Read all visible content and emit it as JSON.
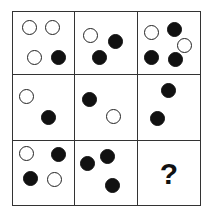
{
  "puzzle": {
    "rows": 3,
    "cols": 3,
    "colors": {
      "black": "#111111",
      "white": "#ffffff",
      "border": "#333333"
    },
    "cells": [
      {
        "row": 0,
        "col": 0,
        "dots": [
          {
            "type": "white",
            "x": 9,
            "y": 8
          },
          {
            "type": "white",
            "x": 32,
            "y": 8
          },
          {
            "type": "white",
            "x": 14,
            "y": 38
          },
          {
            "type": "black",
            "x": 38,
            "y": 38
          }
        ]
      },
      {
        "row": 0,
        "col": 1,
        "dots": [
          {
            "type": "white",
            "x": 8,
            "y": 16
          },
          {
            "type": "black",
            "x": 33,
            "y": 22
          },
          {
            "type": "black",
            "x": 17,
            "y": 38
          }
        ]
      },
      {
        "row": 0,
        "col": 2,
        "dots": [
          {
            "type": "white",
            "x": 6,
            "y": 13
          },
          {
            "type": "black",
            "x": 29,
            "y": 10
          },
          {
            "type": "white",
            "x": 39,
            "y": 26
          },
          {
            "type": "black",
            "x": 6,
            "y": 38
          },
          {
            "type": "black",
            "x": 30,
            "y": 40
          }
        ]
      },
      {
        "row": 1,
        "col": 0,
        "dots": [
          {
            "type": "white",
            "x": 6,
            "y": 14
          },
          {
            "type": "black",
            "x": 28,
            "y": 35
          }
        ]
      },
      {
        "row": 1,
        "col": 1,
        "dots": [
          {
            "type": "black",
            "x": 7,
            "y": 17
          },
          {
            "type": "white",
            "x": 31,
            "y": 34
          }
        ]
      },
      {
        "row": 1,
        "col": 2,
        "dots": [
          {
            "type": "black",
            "x": 23,
            "y": 8
          },
          {
            "type": "black",
            "x": 12,
            "y": 36
          }
        ]
      },
      {
        "row": 2,
        "col": 0,
        "dots": [
          {
            "type": "white",
            "x": 6,
            "y": 5
          },
          {
            "type": "black",
            "x": 38,
            "y": 6
          },
          {
            "type": "black",
            "x": 10,
            "y": 30
          },
          {
            "type": "white",
            "x": 34,
            "y": 31
          }
        ]
      },
      {
        "row": 2,
        "col": 1,
        "dots": [
          {
            "type": "black",
            "x": 5,
            "y": 15
          },
          {
            "type": "black",
            "x": 25,
            "y": 8
          },
          {
            "type": "black",
            "x": 30,
            "y": 37
          }
        ]
      },
      {
        "row": 2,
        "col": 2,
        "question": "?"
      }
    ]
  }
}
